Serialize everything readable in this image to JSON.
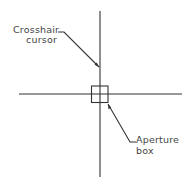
{
  "diagram": {
    "labels": {
      "crosshair_line1": "Crosshair",
      "crosshair_line2": "cursor",
      "aperture_line1": "Aperture",
      "aperture_line2": "box"
    },
    "colors": {
      "stroke": "#333333",
      "text": "#444444"
    }
  }
}
